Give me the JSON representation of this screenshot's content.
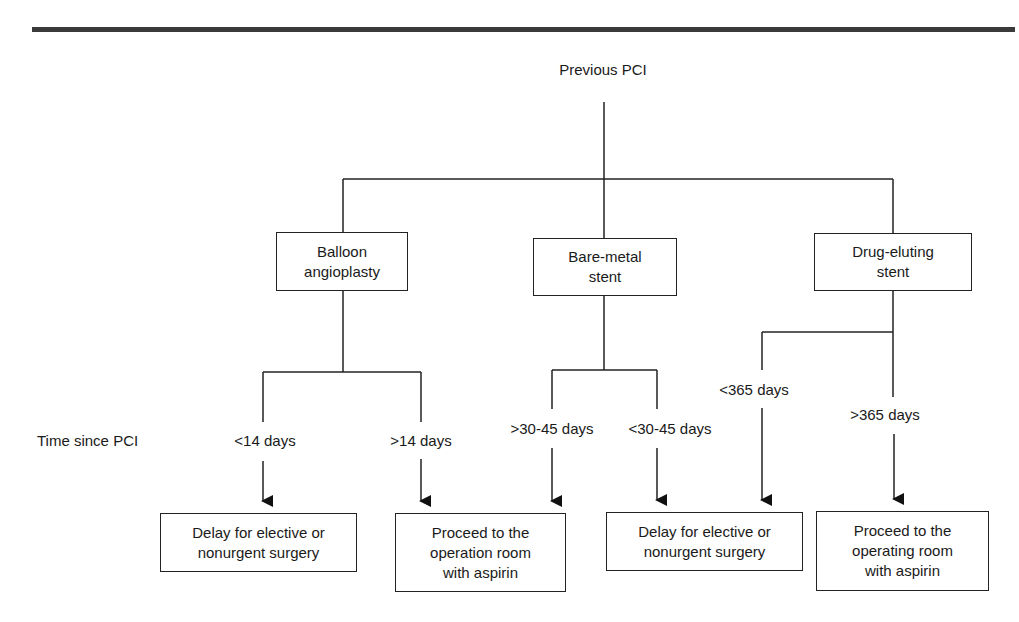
{
  "root": {
    "label": "Previous PCI"
  },
  "row_label": "Time since PCI",
  "stent_types": [
    {
      "id": "balloon",
      "lines": [
        "Balloon",
        "angioplasty"
      ]
    },
    {
      "id": "bare-metal",
      "lines": [
        "Bare-metal",
        "stent"
      ]
    },
    {
      "id": "drug-eluting",
      "lines": [
        "Drug-eluting",
        "stent"
      ]
    }
  ],
  "time_branches": {
    "balloon": [
      "<14 days",
      ">14 days"
    ],
    "bare_metal": [
      ">30-45 days",
      "<30-45 days"
    ],
    "drug_eluting": [
      "<365 days",
      ">365 days"
    ]
  },
  "outcomes": [
    {
      "id": "delay-1",
      "lines": [
        "Delay for elective or",
        "nonurgent surgery"
      ]
    },
    {
      "id": "proceed-1",
      "lines": [
        "Proceed to the",
        "operation room",
        "with aspirin"
      ]
    },
    {
      "id": "delay-2",
      "lines": [
        "Delay for elective or",
        "nonurgent surgery"
      ]
    },
    {
      "id": "proceed-2",
      "lines": [
        "Proceed to the",
        "operating room",
        "with aspirin"
      ]
    }
  ],
  "colors": {
    "line": "#222222",
    "rule": "#3a3a3a",
    "text": "#1a1a1a",
    "background": "#ffffff"
  }
}
